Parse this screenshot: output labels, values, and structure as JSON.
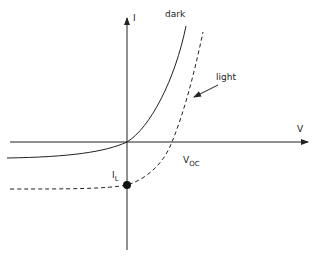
{
  "labels": {
    "y_axis": "I",
    "x_axis": "V",
    "dark": "dark",
    "light": "light",
    "voc": "V",
    "voc_sub": "OC",
    "il": "I",
    "il_sub": "L"
  },
  "colors": {
    "line": "#222222",
    "background": "#ffffff"
  }
}
